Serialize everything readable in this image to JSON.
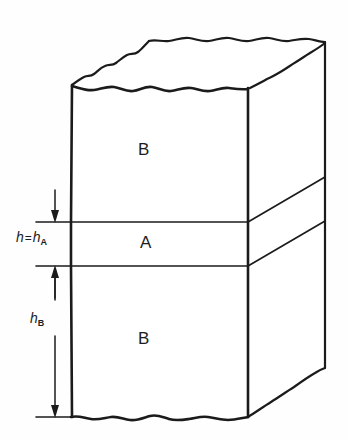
{
  "figure": {
    "background_color": "#fefefe",
    "line_color": "#1b1b1b"
  },
  "layers": [
    {
      "id": "layer-b-top",
      "label": "B",
      "position": "top",
      "face": "front"
    },
    {
      "id": "layer-a-middle",
      "label": "A",
      "position": "middle",
      "face": "front"
    },
    {
      "id": "layer-b-bottom",
      "label": "B",
      "position": "bottom",
      "face": "front"
    }
  ],
  "dimensions": [
    {
      "id": "dim-h-ha",
      "symbol": "h",
      "equals": "=",
      "symbol2": "h",
      "subscript2": "A",
      "text": "h = h",
      "describes": "thickness of layer A"
    },
    {
      "id": "dim-hb",
      "symbol": "h",
      "subscript": "B",
      "text": "h",
      "describes": "thickness of lower layer B"
    }
  ],
  "annotations": {
    "top_surface": "torn-edge",
    "bottom_surface": "torn-edge",
    "projection": "oblique-isometric"
  }
}
